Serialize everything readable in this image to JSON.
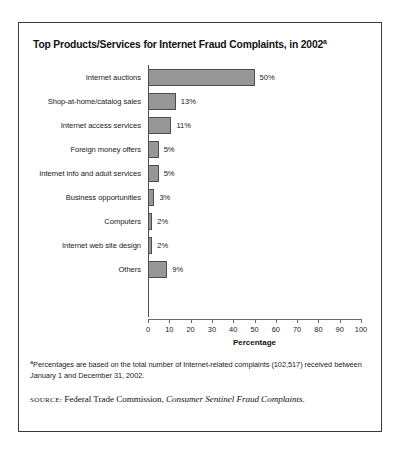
{
  "figure": {
    "title": "Top Products/Services for Internet Fraud Complaints, in 2002",
    "title_superscript": "a",
    "footnote_marker": "a",
    "footnote": "Percentages are based on the total number of Internet-related complaints (102,517) received between January 1 and December 31, 2002.",
    "source_label": "SOURCE:",
    "source_agency": "Federal Trade Commission,",
    "source_publication": "Consumer Sentinel Fraud Complaints",
    "source_terminator": "."
  },
  "chart_data": {
    "type": "bar",
    "orientation": "horizontal",
    "title": "Top Products/Services for Internet Fraud Complaints, in 2002",
    "xlabel": "Percentage",
    "ylabel": "",
    "xlim": [
      0,
      100
    ],
    "xticks": [
      0,
      10,
      20,
      30,
      40,
      50,
      60,
      70,
      80,
      90,
      100
    ],
    "xtick_labels": [
      "0",
      "10",
      "20",
      "30",
      "40",
      "50",
      "60",
      "70",
      "80",
      "90",
      "100"
    ],
    "grid": false,
    "legend": false,
    "bar_fill_color": "#979797",
    "bar_edge_color": "#4d4d4d",
    "categories": [
      "Internet auctions",
      "Shop-at-home/catalog sales",
      "Internet access services",
      "Foreign money offers",
      "Internet info and adult services",
      "Business opportunities",
      "Computers",
      "Internet web site design",
      "Others"
    ],
    "values": [
      50,
      13,
      11,
      5,
      5,
      3,
      2,
      2,
      9
    ],
    "data_labels": [
      "50%",
      "13%",
      "11%",
      "5%",
      "5%",
      "3%",
      "2%",
      "2%",
      "9%"
    ],
    "bars": [
      {
        "category": "Internet auctions",
        "value": 50,
        "label": "50%"
      },
      {
        "category": "Shop-at-home/catalog sales",
        "value": 13,
        "label": "13%"
      },
      {
        "category": "Internet access services",
        "value": 11,
        "label": "11%"
      },
      {
        "category": "Foreign money offers",
        "value": 5,
        "label": "5%"
      },
      {
        "category": "Internet info and adult services",
        "value": 5,
        "label": "5%"
      },
      {
        "category": "Business opportunities",
        "value": 3,
        "label": "3%"
      },
      {
        "category": "Computers",
        "value": 2,
        "label": "2%"
      },
      {
        "category": "Internet web site design",
        "value": 2,
        "label": "2%"
      },
      {
        "category": "Others",
        "value": 9,
        "label": "9%"
      }
    ]
  }
}
